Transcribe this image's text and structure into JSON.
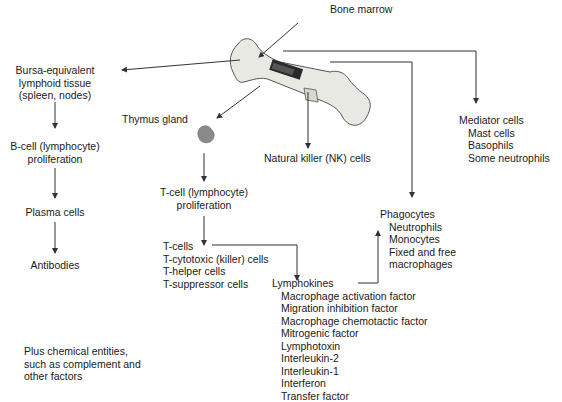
{
  "title": "Bone marrow",
  "bursa": {
    "lines": [
      "Bursa-equivalent",
      "lymphoid tissue",
      "(spleen, nodes)"
    ]
  },
  "bcell": {
    "lines": [
      "B-cell (lymphocyte)",
      "proliferation"
    ]
  },
  "plasma": "Plasma cells",
  "antibodies": "Antibodies",
  "thymus": "Thymus gland",
  "tcell_prolif": {
    "lines": [
      "T-cell (lymphocyte)",
      "proliferation"
    ]
  },
  "tcells": {
    "heading": "T-cells",
    "items": [
      "T-cytotoxic (killer) cells",
      "T-helper cells",
      "T-suppressor cells"
    ]
  },
  "nk": "Natural killer (NK) cells",
  "mediator": {
    "heading": "Mediator cells",
    "items": [
      "Mast cells",
      "Basophils",
      "Some neutrophils"
    ]
  },
  "phagocytes": {
    "heading": "Phagocytes",
    "items": [
      "Neutrophils",
      "Monocytes",
      "Fixed and free",
      "macrophages"
    ]
  },
  "lymphokines": {
    "heading": "Lymphokines",
    "items": [
      "Macrophage activation factor",
      "Migration inhibition factor",
      "Macrophage chemotactic factor",
      "Mitrogenic factor",
      "Lymphotoxin",
      "Interleukin-2",
      "Interleukin-1",
      "Interferon",
      "Transfer factor"
    ]
  },
  "plus": {
    "lines": [
      "Plus chemical entities,",
      "such as complement and",
      "other factors"
    ]
  },
  "colors": {
    "line": "#333333",
    "bone_fill": "#e9e9e4",
    "bone_stroke": "#555555",
    "thymus": "#8a8a8a"
  }
}
